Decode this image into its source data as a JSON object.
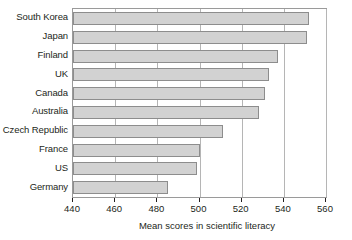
{
  "chart_data": {
    "type": "bar",
    "orientation": "horizontal",
    "title": "",
    "xlabel": "Mean scores in scientific literacy",
    "ylabel": "",
    "xlim": [
      440,
      560
    ],
    "xticks": [
      440,
      460,
      480,
      500,
      520,
      540,
      560
    ],
    "xtick_labels": [
      "440",
      "460",
      "480",
      "500",
      "520",
      "540",
      "560"
    ],
    "grid": true,
    "grid_axis": "x",
    "legend": false,
    "categories": [
      "South Korea",
      "Japan",
      "Finland",
      "UK",
      "Canada",
      "Australia",
      "Czech Republic",
      "France",
      "US",
      "Germany"
    ],
    "values": [
      552,
      551,
      537,
      533,
      531,
      528,
      511,
      500,
      499,
      485
    ],
    "bar_color": "#d2d2d2",
    "bar_border_color": "#8d8d8d",
    "axis_color": "#9a9a9a",
    "grid_color": "#b5b5b5",
    "text_color": "#231f20"
  }
}
